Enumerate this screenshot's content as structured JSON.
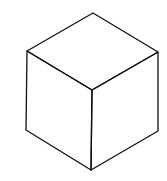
{
  "diagram": {
    "type": "isometric-cube-line-drawing",
    "stroke_color": "#111111",
    "background": "#ffffff",
    "vertices": {
      "top": [
        93,
        13
      ],
      "upper_left": [
        27,
        51
      ],
      "upper_right": [
        158,
        52
      ],
      "center": [
        92,
        90
      ],
      "lower_left": [
        26,
        130
      ],
      "lower_right": [
        158,
        131
      ],
      "bottom": [
        91,
        170
      ]
    },
    "faces": [
      "top",
      "left",
      "right"
    ]
  }
}
